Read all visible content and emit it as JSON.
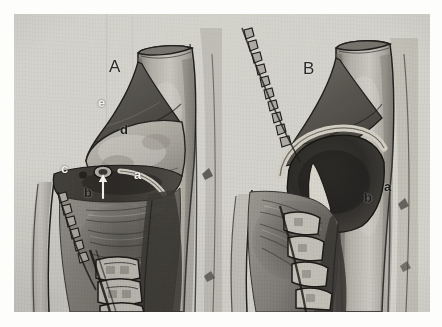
{
  "plate": {
    "kind": "grayscale-anatomical-illustration",
    "background_color": "#fdfdfc",
    "figure_background_color": "#d9d8d2",
    "panel_count": 2
  },
  "panels": [
    {
      "id": "A",
      "title": "A",
      "labels": [
        {
          "key": "a",
          "text": "a",
          "style": "light",
          "x": 134,
          "y": 168
        },
        {
          "key": "b",
          "text": "b",
          "style": "dark",
          "x": 84,
          "y": 186
        },
        {
          "key": "c",
          "text": "c",
          "style": "light",
          "x": 61,
          "y": 162
        },
        {
          "key": "d",
          "text": "d",
          "style": "dark",
          "x": 120,
          "y": 123
        },
        {
          "key": "e",
          "text": "e",
          "style": "light",
          "x": 98,
          "y": 96
        }
      ],
      "pointers": [
        {
          "name": "arrow-to-b",
          "from_x": 89,
          "from_y": 184,
          "to_x": 89,
          "to_y": 163
        }
      ]
    },
    {
      "id": "B",
      "title": "B",
      "labels": [
        {
          "key": "a",
          "text": "a",
          "style": "dark",
          "x": 384,
          "y": 180
        },
        {
          "key": "b",
          "text": "b",
          "style": "dark",
          "x": 364,
          "y": 191
        }
      ],
      "pointers": []
    }
  ],
  "colors": {
    "ink_dark": "#1d1d1b",
    "ink_light": "#f2f1ec",
    "paper": "#d9d8d2",
    "bone_light": "#cfcdc6",
    "bone_mid": "#a9a69d",
    "soft_tissue_dark": "#4e4c48",
    "shadow": "#35332f",
    "outline": "#1f1e1c"
  },
  "title_labels": {
    "panel_a": "A",
    "panel_b": "B"
  }
}
